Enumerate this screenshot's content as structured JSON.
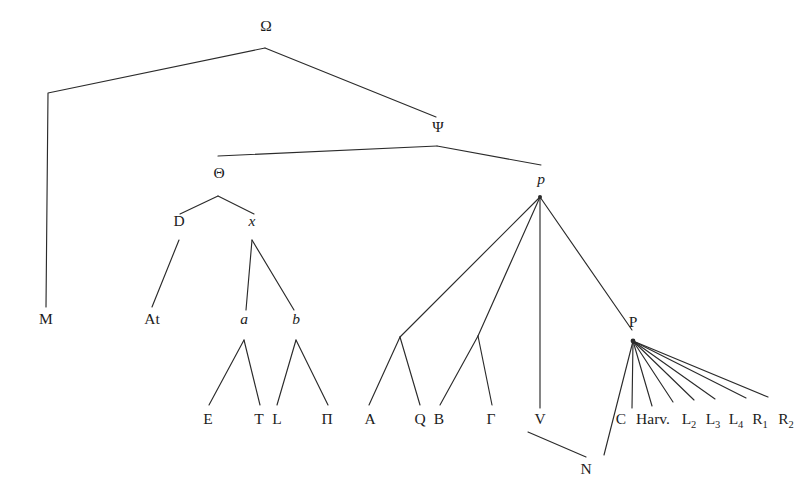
{
  "diagram": {
    "kind": "stemma-codicum",
    "title": "",
    "background_color": "#ffffff",
    "line_color": "#2b2b2b",
    "text_color": "#1c1c1c",
    "width": 810,
    "height": 498
  },
  "nodes": [
    {
      "id": "omega",
      "label": "Ω",
      "style": "upright",
      "x": 266,
      "y": 31,
      "anchor_x": 265,
      "anchor_y": 48,
      "interactable": false
    },
    {
      "id": "psi",
      "label": "Ψ",
      "style": "upright",
      "x": 438,
      "y": 132,
      "anchor_x": 437,
      "anchor_y": 146,
      "interactable": false
    },
    {
      "id": "theta",
      "label": "Θ",
      "style": "upright",
      "x": 219,
      "y": 178,
      "anchor_x": 218,
      "anchor_y": 196,
      "interactable": false
    },
    {
      "id": "p_low",
      "label": "p",
      "style": "italic",
      "x": 541,
      "y": 184,
      "anchor_x": 540,
      "anchor_y": 197,
      "interactable": false
    },
    {
      "id": "m",
      "label": "M",
      "style": "upright",
      "x": 46,
      "y": 324,
      "anchor_x": 46,
      "anchor_y": 307,
      "interactable": false
    },
    {
      "id": "d",
      "label": "D",
      "style": "upright",
      "x": 179,
      "y": 226,
      "anchor_x": 179,
      "anchor_y": 240,
      "interactable": false
    },
    {
      "id": "x",
      "label": "x",
      "style": "italic",
      "x": 252,
      "y": 226,
      "anchor_x": 252,
      "anchor_y": 240,
      "interactable": false
    },
    {
      "id": "at",
      "label": "At",
      "style": "upright",
      "x": 152,
      "y": 324,
      "anchor_x": 152,
      "anchor_y": 307,
      "interactable": false
    },
    {
      "id": "a",
      "label": "a",
      "style": "italic",
      "x": 244,
      "y": 324,
      "anchor_x": 244,
      "anchor_y": 340,
      "interactable": false
    },
    {
      "id": "b",
      "label": "b",
      "style": "italic",
      "x": 296,
      "y": 324,
      "anchor_x": 296,
      "anchor_y": 340,
      "interactable": false
    },
    {
      "id": "e",
      "label": "E",
      "style": "upright",
      "x": 208,
      "y": 424,
      "anchor_x": 208,
      "anchor_y": 408,
      "interactable": false
    },
    {
      "id": "t",
      "label": "T",
      "style": "upright",
      "x": 259,
      "y": 424,
      "anchor_x": 259,
      "anchor_y": 408,
      "interactable": false
    },
    {
      "id": "l",
      "label": "L",
      "style": "upright",
      "x": 277,
      "y": 424,
      "anchor_x": 277,
      "anchor_y": 408,
      "interactable": false
    },
    {
      "id": "pi",
      "label": "Π",
      "style": "upright",
      "x": 327,
      "y": 424,
      "anchor_x": 327,
      "anchor_y": 408,
      "interactable": false
    },
    {
      "id": "fork1",
      "label": "",
      "style": "upright",
      "x": 400,
      "y": 337,
      "anchor_x": 400,
      "anchor_y": 337,
      "interactable": false
    },
    {
      "id": "fork2",
      "label": "",
      "style": "upright",
      "x": 478,
      "y": 336,
      "anchor_x": 478,
      "anchor_y": 336,
      "interactable": false
    },
    {
      "id": "a_cap",
      "label": "A",
      "style": "upright",
      "x": 370,
      "y": 424,
      "anchor_x": 370,
      "anchor_y": 408,
      "interactable": false
    },
    {
      "id": "q",
      "label": "Q",
      "style": "upright",
      "x": 420,
      "y": 424,
      "anchor_x": 420,
      "anchor_y": 408,
      "interactable": false
    },
    {
      "id": "b_cap",
      "label": "B",
      "style": "upright",
      "x": 439,
      "y": 424,
      "anchor_x": 439,
      "anchor_y": 408,
      "interactable": false
    },
    {
      "id": "gamma",
      "label": "Γ",
      "style": "upright",
      "x": 491,
      "y": 424,
      "anchor_x": 491,
      "anchor_y": 408,
      "interactable": false
    },
    {
      "id": "v",
      "label": "V",
      "style": "upright",
      "x": 540,
      "y": 424,
      "anchor_x": 540,
      "anchor_y": 408,
      "interactable": false
    },
    {
      "id": "n",
      "label": "N",
      "style": "upright",
      "x": 586,
      "y": 474,
      "anchor_x": 586,
      "anchor_y": 457,
      "interactable": false
    },
    {
      "id": "p_cap",
      "label": "P",
      "style": "upright",
      "x": 633,
      "y": 327,
      "anchor_x": 633,
      "anchor_y": 341,
      "interactable": false
    },
    {
      "id": "c",
      "label": "C",
      "style": "upright",
      "x": 621,
      "y": 424,
      "anchor_x": 621,
      "anchor_y": 408,
      "interactable": false
    },
    {
      "id": "harv",
      "label": "Harv.",
      "style": "upright",
      "x": 653,
      "y": 424,
      "anchor_x": 649,
      "anchor_y": 408,
      "interactable": false
    },
    {
      "id": "l2",
      "label": "L",
      "sub": "2",
      "style": "upright",
      "x": 689,
      "y": 424,
      "anchor_x": 687,
      "anchor_y": 408,
      "interactable": false
    },
    {
      "id": "l3",
      "label": "L",
      "sub": "3",
      "style": "upright",
      "x": 713,
      "y": 424,
      "anchor_x": 710,
      "anchor_y": 408,
      "interactable": false
    },
    {
      "id": "l4",
      "label": "L",
      "sub": "4",
      "style": "upright",
      "x": 736,
      "y": 424,
      "anchor_x": 733,
      "anchor_y": 408,
      "interactable": false
    },
    {
      "id": "r1",
      "label": "R",
      "sub": "1",
      "style": "upright",
      "x": 760,
      "y": 424,
      "anchor_x": 757,
      "anchor_y": 408,
      "interactable": false
    },
    {
      "id": "r2",
      "label": "R",
      "sub": "2",
      "style": "upright",
      "x": 786,
      "y": 424,
      "anchor_x": 783,
      "anchor_y": 408,
      "interactable": false
    }
  ],
  "edges": [
    {
      "id": "omega-m",
      "from": "omega",
      "to": "m",
      "points": [
        [
          265,
          48
        ],
        [
          48,
          93
        ],
        [
          46,
          307
        ]
      ]
    },
    {
      "id": "omega-psi",
      "from": "omega",
      "to": "psi",
      "points": [
        [
          265,
          48
        ],
        [
          436,
          117
        ]
      ]
    },
    {
      "id": "psi-theta",
      "from": "psi",
      "to": "theta",
      "points": [
        [
          437,
          146
        ],
        [
          218,
          156
        ]
      ]
    },
    {
      "id": "psi-p",
      "from": "psi",
      "to": "p_low",
      "points": [
        [
          437,
          146
        ],
        [
          541,
          165
        ]
      ]
    },
    {
      "id": "theta-d",
      "from": "theta",
      "to": "d",
      "points": [
        [
          218,
          196
        ],
        [
          180,
          214
        ]
      ]
    },
    {
      "id": "theta-x",
      "from": "theta",
      "to": "x",
      "points": [
        [
          218,
          196
        ],
        [
          254,
          214
        ]
      ]
    },
    {
      "id": "d-at",
      "from": "d",
      "to": "at",
      "points": [
        [
          179,
          240
        ],
        [
          152,
          307
        ]
      ]
    },
    {
      "id": "x-a",
      "from": "x",
      "to": "a",
      "points": [
        [
          252,
          240
        ],
        [
          246,
          310
        ]
      ]
    },
    {
      "id": "x-b",
      "from": "x",
      "to": "b",
      "points": [
        [
          252,
          240
        ],
        [
          294,
          310
        ]
      ]
    },
    {
      "id": "a-e",
      "from": "a",
      "to": "e",
      "points": [
        [
          244,
          340
        ],
        [
          209,
          405
        ]
      ]
    },
    {
      "id": "a-t",
      "from": "a",
      "to": "t",
      "points": [
        [
          244,
          340
        ],
        [
          260,
          405
        ]
      ]
    },
    {
      "id": "b-l",
      "from": "b",
      "to": "l",
      "points": [
        [
          296,
          340
        ],
        [
          277,
          405
        ]
      ]
    },
    {
      "id": "b-pi",
      "from": "b",
      "to": "pi",
      "points": [
        [
          296,
          340
        ],
        [
          328,
          405
        ]
      ]
    },
    {
      "id": "p-fork1",
      "from": "p_low",
      "to": "fork1",
      "points": [
        [
          540,
          197
        ],
        [
          400,
          337
        ]
      ]
    },
    {
      "id": "p-fork2",
      "from": "p_low",
      "to": "fork2",
      "points": [
        [
          540,
          197
        ],
        [
          478,
          336
        ]
      ]
    },
    {
      "id": "p-v",
      "from": "p_low",
      "to": "v",
      "points": [
        [
          540,
          197
        ],
        [
          540,
          408
        ]
      ]
    },
    {
      "id": "p-pcap",
      "from": "p_low",
      "to": "p_cap",
      "points": [
        [
          540,
          197
        ],
        [
          632,
          330
        ]
      ]
    },
    {
      "id": "fork1-a",
      "from": "fork1",
      "to": "a_cap",
      "points": [
        [
          400,
          337
        ],
        [
          369,
          405
        ]
      ]
    },
    {
      "id": "fork1-q",
      "from": "fork1",
      "to": "q",
      "points": [
        [
          400,
          337
        ],
        [
          420,
          405
        ]
      ]
    },
    {
      "id": "fork2-b",
      "from": "fork2",
      "to": "b_cap",
      "points": [
        [
          478,
          336
        ],
        [
          440,
          405
        ]
      ]
    },
    {
      "id": "fork2-gamma",
      "from": "fork2",
      "to": "gamma",
      "points": [
        [
          478,
          336
        ],
        [
          492,
          405
        ]
      ]
    },
    {
      "id": "v-n",
      "from": "v",
      "to": "n",
      "points": [
        [
          528,
          432
        ],
        [
          586,
          457
        ]
      ]
    },
    {
      "id": "pcap-c",
      "from": "p_cap",
      "to": "c",
      "points": [
        [
          633,
          341
        ],
        [
          604,
          455
        ]
      ]
    },
    {
      "id": "pcap-harv",
      "from": "p_cap",
      "to": "harv",
      "points": [
        [
          633,
          341
        ],
        [
          632,
          408
        ]
      ]
    },
    {
      "id": "pcap-l2",
      "from": "p_cap",
      "to": "l2",
      "points": [
        [
          633,
          341
        ],
        [
          652,
          406
        ]
      ]
    },
    {
      "id": "pcap-l3",
      "from": "p_cap",
      "to": "l3",
      "points": [
        [
          633,
          341
        ],
        [
          673,
          402
        ]
      ]
    },
    {
      "id": "pcap-l4",
      "from": "p_cap",
      "to": "l4",
      "points": [
        [
          633,
          341
        ],
        [
          694,
          400
        ]
      ]
    },
    {
      "id": "pcap-r1",
      "from": "p_cap",
      "to": "r1",
      "points": [
        [
          633,
          341
        ],
        [
          715,
          399
        ]
      ]
    },
    {
      "id": "pcap-r2",
      "from": "p_cap",
      "to": "r2",
      "points": [
        [
          633,
          341
        ],
        [
          746,
          398
        ]
      ]
    },
    {
      "id": "pcap-extra",
      "from": "p_cap",
      "to": "r2",
      "points": [
        [
          633,
          341
        ],
        [
          768,
          397
        ]
      ]
    }
  ],
  "junctions": [
    {
      "id": "junction-p",
      "x": 540,
      "y": 197,
      "r": 2.0
    },
    {
      "id": "junction-pcap",
      "x": 633,
      "y": 341,
      "r": 2.4
    }
  ]
}
